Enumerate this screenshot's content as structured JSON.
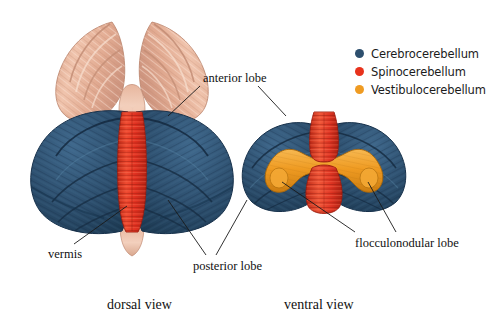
{
  "figure": {
    "background_color": "#ffffff"
  },
  "legend": {
    "items": [
      {
        "label": "Cerebrocerebellum",
        "color": "#2d4f6e",
        "dot_name": "legend-dot-cerebrocerebellum"
      },
      {
        "label": "Spinocerebellum",
        "color": "#e8321c",
        "dot_name": "legend-dot-spinocerebellum"
      },
      {
        "label": "Vestibulocerebellum",
        "color": "#ef9b22",
        "dot_name": "legend-dot-vestibulocerebellum"
      }
    ]
  },
  "annotations": {
    "anterior_lobe": "anterior lobe",
    "vermis": "vermis",
    "posterior_lobe": "posterior lobe",
    "flocculonodular_lobe": "flocculonodular lobe"
  },
  "captions": {
    "dorsal": "dorsal view",
    "ventral": "ventral view"
  },
  "colors": {
    "cerebrocerebellum_blue": "#2d4f6e",
    "blue_dark": "#1d3a54",
    "blue_light": "#3d6385",
    "spinocerebellum_red": "#e03020",
    "red_dark": "#b21f12",
    "red_light": "#f2604a",
    "vestibulocerebellum_orange": "#ef9b22",
    "orange_dark": "#c77a12",
    "orange_light": "#f7b851",
    "brainstem_flesh": "#e8b49c",
    "flesh_dark": "#c68f76",
    "flesh_light": "#f4d3c2",
    "leader_line": "#1a1a1a",
    "text": "#111111"
  }
}
